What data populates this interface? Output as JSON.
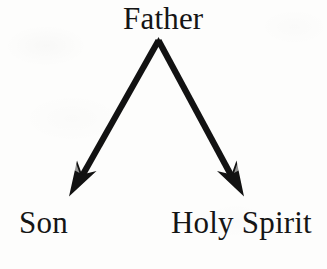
{
  "figure": {
    "title_text": "Father",
    "background_color": "#fdfdfc",
    "ink_color": "#151515",
    "nodes": [
      {
        "id": "father",
        "label": "Father",
        "role": "source",
        "position": "top-center"
      },
      {
        "id": "son",
        "label": "Son",
        "role": "target",
        "position": "bottom-left"
      },
      {
        "id": "holy-spirit",
        "label": "Holy Spirit",
        "role": "target",
        "position": "bottom-right"
      }
    ],
    "arrows": [
      {
        "id": "father-to-son",
        "from": "father",
        "to": "son",
        "direction": "down-left",
        "style": "solid-barbed",
        "color": "#121212"
      },
      {
        "id": "father-to-holy-spirit",
        "from": "father",
        "to": "holy-spirit",
        "direction": "down-right",
        "style": "solid-barbed",
        "color": "#121212"
      }
    ]
  }
}
